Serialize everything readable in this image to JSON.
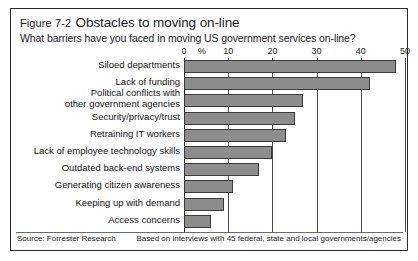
{
  "figure": {
    "number": "Figure 7-2",
    "title": "Obstacles to moving on-line",
    "subtitle": "What barriers have you faced in moving US government services on-line?",
    "source": "Source: Forrester Research",
    "note": "Based on interviews with 45 federal, state and local governments/agencies"
  },
  "colors": {
    "bar_fill": "#8d8d8d",
    "bar_stroke": "#3b3b3b",
    "frame": "#2a2a2a",
    "gridline": "#4a4a4a",
    "text": "#1a1a1a"
  },
  "chart_data": {
    "type": "bar",
    "orientation": "horizontal",
    "title": "Obstacles to moving on-line",
    "subtitle": "What barriers have you faced in moving US government services on-line?",
    "xlabel": "%",
    "ylabel": "",
    "xlim": [
      0,
      50
    ],
    "xticks": [
      0,
      10,
      20,
      30,
      40,
      50
    ],
    "xtick_labels": [
      "0",
      "10",
      "20",
      "30",
      "40",
      "50"
    ],
    "percent_marker": "%",
    "grid": true,
    "legend": false,
    "categories": [
      "Siloed departments",
      "Lack of funding",
      "Political conflicts with other government agencies",
      "Security/privacy/trust",
      "Retraining IT workers",
      "Lack of employee technology skills",
      "Outdated back-end systems",
      "Generating citizen awareness",
      "Keeping up with demand",
      "Access concerns"
    ],
    "category_lines": [
      [
        "Siloed departments"
      ],
      [
        "Lack of funding"
      ],
      [
        "Political conflicts with",
        "other government agencies"
      ],
      [
        "Security/privacy/trust"
      ],
      [
        "Retraining IT workers"
      ],
      [
        "Lack of employee technology skills"
      ],
      [
        "Outdated back-end systems"
      ],
      [
        "Generating citizen awareness"
      ],
      [
        "Keeping up with demand"
      ],
      [
        "Access concerns"
      ]
    ],
    "values": [
      48,
      42,
      27,
      25,
      23,
      20,
      17,
      11,
      9,
      6
    ],
    "source": "Forrester Research",
    "annotation": "Based on interviews with 45 federal, state and local governments/agencies"
  }
}
